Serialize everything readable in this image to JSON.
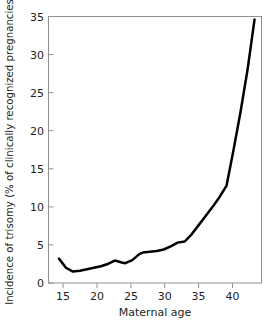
{
  "chart_data": {
    "type": "line",
    "title": "",
    "xlabel": "Maternal age",
    "ylabel": "Incidence of trisomy (% of clinically recognized pregnancies)",
    "xlim": [
      13.5,
      44
    ],
    "ylim": [
      0,
      35
    ],
    "grid": false,
    "legend": "none",
    "xticks": [
      15,
      20,
      25,
      30,
      35,
      40
    ],
    "xtick_labels": [
      "15",
      "20",
      "25",
      "30",
      "35",
      "40"
    ],
    "yticks": [
      0,
      5,
      10,
      15,
      20,
      25,
      30,
      35
    ],
    "ytick_labels": [
      "0",
      "5",
      "10",
      "15",
      "20",
      "25",
      "30",
      "35"
    ],
    "series": [
      {
        "name": "Incidence of trisomy",
        "color": "#000000",
        "line_width": 2.5,
        "x": [
          15,
          16,
          17,
          18,
          19,
          20,
          21,
          22,
          23,
          24,
          24.5,
          25.5,
          26.5,
          27,
          28,
          29,
          30,
          31,
          32,
          33,
          34,
          35,
          36,
          37,
          38,
          39,
          40,
          41,
          42,
          43
        ],
        "y": [
          3.2,
          2.0,
          1.5,
          1.6,
          1.8,
          2.0,
          2.2,
          2.5,
          2.95,
          2.7,
          2.6,
          3.0,
          3.8,
          4.0,
          4.1,
          4.2,
          4.4,
          4.8,
          5.3,
          5.45,
          6.4,
          7.6,
          8.8,
          10.0,
          11.3,
          12.8,
          17.5,
          22.5,
          28.0,
          34.6
        ]
      }
    ]
  },
  "axes": {
    "frame_color": "#808080",
    "tick_color": "#808080"
  }
}
